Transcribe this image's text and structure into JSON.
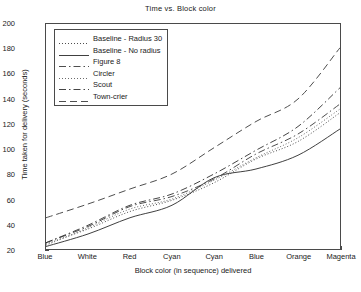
{
  "chart_data": {
    "type": "line",
    "title": "Time vs. Block color",
    "xlabel": "Block color (in sequence) delivered",
    "ylabel": "Time taken for delivery (seconds)",
    "categories": [
      "Blue",
      "White",
      "Red",
      "Cyan",
      "Cyan",
      "Blue",
      "Orange",
      "Magenta"
    ],
    "ylim": [
      20,
      200
    ],
    "ytick_labels": [
      "20",
      "40",
      "60",
      "80",
      "100",
      "120",
      "140",
      "160",
      "180",
      "200"
    ],
    "ytick_values": [
      20,
      40,
      60,
      80,
      100,
      120,
      140,
      160,
      180,
      200
    ],
    "grid": false,
    "legend_position": "upper left",
    "series": [
      {
        "name": "Baseline - Radius 30",
        "style": "dotted",
        "color": "#3a3a3a",
        "values": [
          24,
          36,
          50,
          59,
          73,
          92,
          106,
          129
        ]
      },
      {
        "name": "Baseline - No radius",
        "style": "solid",
        "color": "#2a2a2a",
        "values": [
          22,
          32,
          45,
          55,
          77,
          84,
          95,
          116
        ]
      },
      {
        "name": "Figure 8",
        "style": "dashdot",
        "color": "#3a3a3a",
        "values": [
          25,
          38,
          54,
          62,
          76,
          96,
          112,
          136
        ]
      },
      {
        "name": "Circler",
        "style": "dotted",
        "color": "#5a5a5a",
        "values": [
          23,
          37,
          52,
          60,
          75,
          93,
          109,
          132
        ]
      },
      {
        "name": "Scout",
        "style": "dashdot",
        "color": "#2f2f2f",
        "values": [
          25,
          39,
          55,
          64,
          80,
          99,
          118,
          149
        ]
      },
      {
        "name": "Town-crier",
        "style": "dashed",
        "color": "#3a3a3a",
        "values": [
          45,
          56,
          68,
          80,
          101,
          122,
          140,
          181
        ]
      }
    ]
  }
}
